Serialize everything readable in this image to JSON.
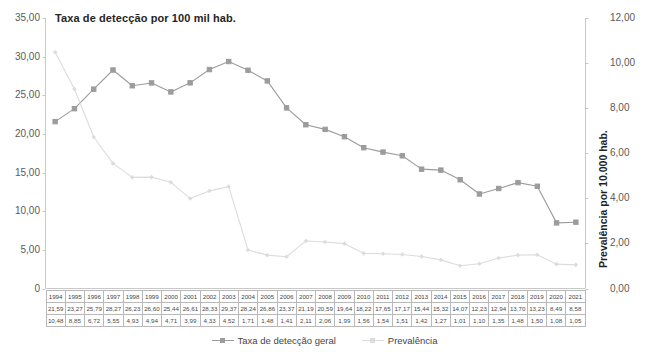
{
  "chart_data": {
    "type": "line",
    "title": "Taxa de detecção por 100 mil hab.",
    "xlabel": "",
    "ylabel": "",
    "y2label": "Prevalência por 10.000 hab.",
    "ylim": [
      0,
      35
    ],
    "y2lim": [
      0,
      12
    ],
    "grid": false,
    "legend_position": "bottom-center",
    "categories": [
      "1994",
      "1995",
      "1996",
      "1997",
      "1998",
      "1999",
      "2000",
      "2001",
      "2002",
      "2003",
      "2004",
      "2005",
      "2006",
      "2007",
      "2008",
      "2009",
      "2010",
      "2011",
      "2012",
      "2013",
      "2014",
      "2015",
      "2016",
      "2017",
      "2018",
      "2019",
      "2020",
      "2021"
    ],
    "series": [
      {
        "name": "Taxa de detecção geral",
        "axis": "left",
        "color": "#9c9c9c",
        "marker": "square",
        "values": [
          21.59,
          23.27,
          25.79,
          28.27,
          26.23,
          26.6,
          25.44,
          26.61,
          28.33,
          29.37,
          28.24,
          26.86,
          23.37,
          21.19,
          20.59,
          19.64,
          18.22,
          17.65,
          17.17,
          15.44,
          15.32,
          14.07,
          12.23,
          12.94,
          13.7,
          13.23,
          8.49,
          8.58
        ]
      },
      {
        "name": "Prevalência",
        "axis": "right",
        "color": "#dcdcdc",
        "marker": "diamond",
        "values": [
          10.48,
          8.85,
          6.72,
          5.55,
          4.93,
          4.94,
          4.71,
          3.99,
          4.33,
          4.52,
          1.71,
          1.48,
          1.41,
          2.11,
          2.06,
          1.99,
          1.56,
          1.54,
          1.51,
          1.42,
          1.27,
          1.01,
          1.1,
          1.35,
          1.48,
          1.5,
          1.08,
          1.05
        ]
      }
    ],
    "yticks_left": [
      "0",
      "5,00",
      "10,00",
      "15,00",
      "20,00",
      "25,00",
      "30,00",
      "35,00"
    ],
    "yticks_right": [
      "0,00",
      "2,00",
      "4,00",
      "6,00",
      "8,00",
      "10,00",
      "12,00"
    ]
  },
  "legend": {
    "items": [
      {
        "label": "Taxa de detecção geral"
      },
      {
        "label": "Prevalência"
      }
    ]
  },
  "data_table": {
    "rows": [
      {
        "name": "years",
        "cells": [
          "1994",
          "1995",
          "1996",
          "1997",
          "1998",
          "1999",
          "2000",
          "2001",
          "2002",
          "2003",
          "2004",
          "2005",
          "2006",
          "2007",
          "2008",
          "2009",
          "2010",
          "2011",
          "2012",
          "2013",
          "2014",
          "2015",
          "2016",
          "2017",
          "2018",
          "2019",
          "2020",
          "2021"
        ]
      },
      {
        "name": "deteccao",
        "cells": [
          "21,59",
          "23,27",
          "25,79",
          "28,27",
          "26,23",
          "26,60",
          "25,44",
          "26,61",
          "28,33",
          "29,37",
          "28,24",
          "26,86",
          "23,37",
          "21,19",
          "20,59",
          "19,64",
          "18,22",
          "17,65",
          "17,17",
          "15,44",
          "15,32",
          "14,07",
          "12,23",
          "12,94",
          "13,70",
          "13,23",
          "8,49",
          "8,58"
        ]
      },
      {
        "name": "prevalencia",
        "cells": [
          "10,48",
          "8,85",
          "6,72",
          "5,55",
          "4,93",
          "4,94",
          "4,71",
          "3,99",
          "4,33",
          "4,52",
          "1,71",
          "1,48",
          "1,41",
          "2,11",
          "2,06",
          "1,99",
          "1,56",
          "1,54",
          "1,51",
          "1,42",
          "1,27",
          "1,01",
          "1,10",
          "1,35",
          "1,48",
          "1,50",
          "1,08",
          "1,05"
        ]
      }
    ]
  }
}
